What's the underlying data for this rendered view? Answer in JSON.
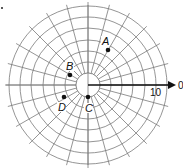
{
  "diagram": {
    "type": "polar-grid",
    "center": {
      "x": 88,
      "y": 85
    },
    "inner_radius": 12,
    "ring_radii": [
      12,
      23,
      34,
      45,
      57,
      68,
      79
    ],
    "spoke_count": 24,
    "spoke_step_deg": 15,
    "colors": {
      "grid": "#7a7a7a",
      "axis": "#111111",
      "points": "#111111"
    },
    "axis": {
      "zero_label": "0",
      "tick_label": "10"
    },
    "points": [
      {
        "label": "A",
        "x": 108,
        "y": 50,
        "lx": 102,
        "ly": 45
      },
      {
        "label": "B",
        "x": 70,
        "y": 75,
        "lx": 66,
        "ly": 70
      },
      {
        "label": "C",
        "x": 88,
        "y": 97,
        "lx": 85,
        "ly": 112
      },
      {
        "label": "D",
        "x": 64,
        "y": 97,
        "lx": 58,
        "ly": 111
      }
    ]
  }
}
